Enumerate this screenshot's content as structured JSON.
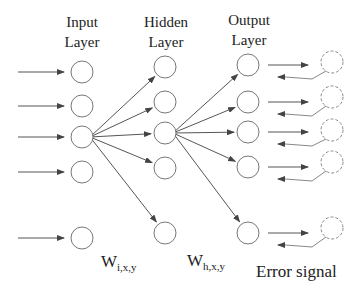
{
  "title_labels": {
    "input": [
      "Input",
      "Layer"
    ],
    "hidden": [
      "Hidden",
      "Layer"
    ],
    "output": [
      "Output",
      "Layer"
    ]
  },
  "weight_labels": {
    "input_hidden": {
      "main": "W",
      "sub": "i,x,y"
    },
    "hidden_output": {
      "main": "W",
      "sub": "h,x,y"
    }
  },
  "error_label": "Error signal",
  "layers": {
    "input": {
      "x": 82,
      "ys": [
        72,
        106,
        137,
        172,
        238
      ]
    },
    "hidden": {
      "x": 165,
      "ys": [
        67,
        102,
        133,
        168,
        233
      ]
    },
    "output": {
      "x": 248,
      "ys": [
        65,
        102,
        132,
        167,
        233
      ]
    },
    "targets": {
      "x": 332,
      "ys": [
        62,
        97,
        130,
        162,
        228
      ]
    }
  },
  "colors": {
    "stroke": "#777777",
    "arrow": "#555555",
    "dashed": "#888888",
    "text": "#222222"
  }
}
